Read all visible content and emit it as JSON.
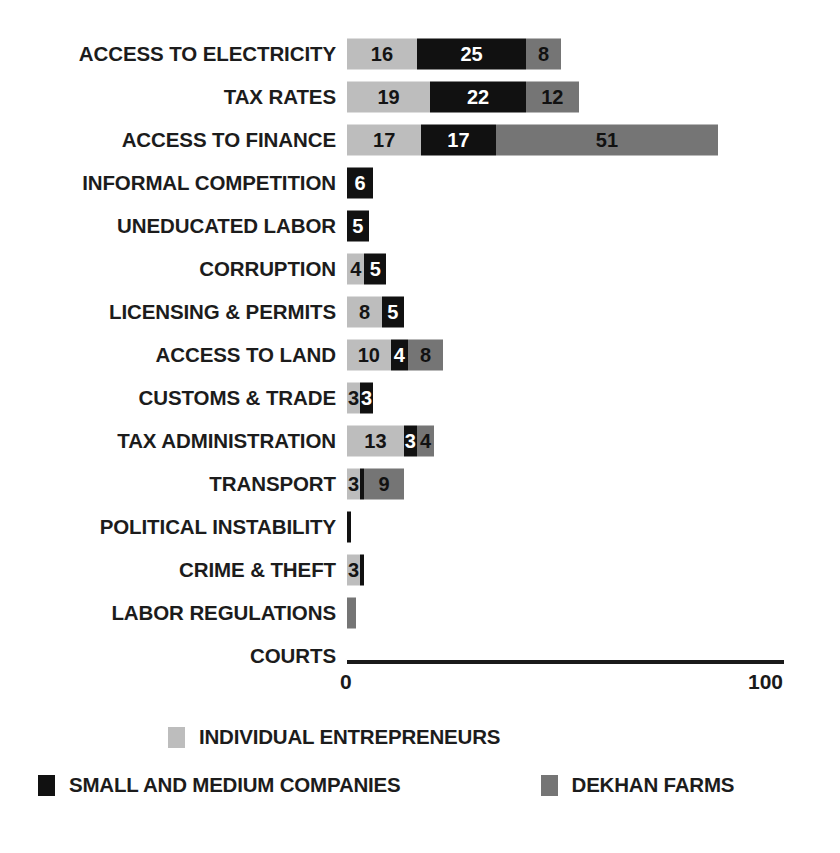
{
  "chart_data": {
    "type": "bar",
    "subtype": "horizontal-stacked",
    "title": "",
    "subtitle": "",
    "xlabel": "",
    "ylabel": "",
    "xlim": [
      0,
      100
    ],
    "grid": false,
    "legend_position": "bottom",
    "axis_ticks": [
      "0",
      "100"
    ],
    "categories": [
      "ACCESS TO ELECTRICITY",
      "TAX RATES",
      "ACCESS TO FINANCE",
      "INFORMAL COMPETITION",
      "UNEDUCATED LABOR",
      "CORRUPTION",
      "LICENSING & PERMITS",
      "ACCESS TO LAND",
      "CUSTOMS & TRADE",
      "TAX ADMINISTRATION",
      "TRANSPORT",
      "POLITICAL INSTABILITY",
      "CRIME & THEFT",
      "LABOR REGULATIONS",
      "COURTS"
    ],
    "series": [
      {
        "name": "INDIVIDUAL ENTREPRENEURS",
        "color": "#bdbdbd",
        "values": [
          16,
          19,
          17,
          0,
          0,
          4,
          8,
          10,
          3,
          13,
          3,
          0,
          3,
          0,
          0
        ],
        "labels": [
          "16",
          "19",
          "17",
          "",
          "",
          "4",
          "8",
          "10",
          "3",
          "13",
          "3",
          "",
          "3",
          "",
          ""
        ]
      },
      {
        "name": "SMALL AND MEDIUM COMPANIES",
        "color": "#111111",
        "values": [
          25,
          22,
          17,
          6,
          5,
          5,
          5,
          4,
          3,
          3,
          1,
          1,
          1,
          0,
          0
        ],
        "labels": [
          "25",
          "22",
          "17",
          "6",
          "5",
          "5",
          "5",
          "4",
          "3",
          "3",
          "",
          "",
          "",
          "",
          ""
        ]
      },
      {
        "name": "DEKHAN FARMS",
        "color": "#757575",
        "values": [
          8,
          12,
          51,
          0,
          0,
          0,
          0,
          8,
          0,
          4,
          9,
          0,
          0,
          2,
          0
        ],
        "labels": [
          "8",
          "12",
          "51",
          "",
          "",
          "",
          "",
          "8",
          "",
          "4",
          "9",
          "",
          "",
          "",
          ""
        ]
      }
    ]
  },
  "legend": {
    "items": [
      {
        "label": "INDIVIDUAL ENTREPRENEURS",
        "color": "#bdbdbd",
        "swatch": "swatch-individual-entrepreneurs"
      },
      {
        "label": "SMALL AND MEDIUM COMPANIES",
        "color": "#111111",
        "swatch": "swatch-small-and-medium-companies"
      },
      {
        "label": "DEKHAN FARMS",
        "color": "#757575",
        "swatch": "swatch-dekhan-farms"
      }
    ]
  },
  "axis": {
    "min_label": "0",
    "max_label": "100"
  },
  "colors": {
    "individual_entrepreneurs": "#bdbdbd",
    "small_and_medium_companies": "#111111",
    "dekhan_farms": "#757575",
    "axis": "#1a1a1a",
    "text": "#1c1c1c",
    "background": "#ffffff"
  }
}
